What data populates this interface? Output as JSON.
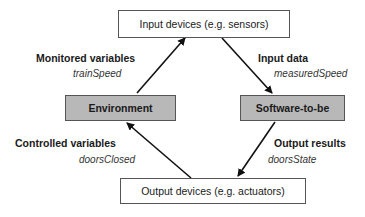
{
  "nodes": {
    "input_devices": {
      "label": "Input devices (e.g. sensors)"
    },
    "environment": {
      "label": "Environment"
    },
    "software": {
      "label": "Software-to-be"
    },
    "output_devices": {
      "label": "Output devices (e.g. actuators)"
    }
  },
  "edges": {
    "monitored": {
      "title": "Monitored variables",
      "example": "trainSpeed",
      "from": "environment",
      "to": "input_devices"
    },
    "input_data": {
      "title": "Input data",
      "example": "measuredSpeed",
      "from": "input_devices",
      "to": "software"
    },
    "output_results": {
      "title": "Output results",
      "example": "doorsState",
      "from": "software",
      "to": "output_devices"
    },
    "controlled": {
      "title": "Controlled variables",
      "example": "doorsClosed",
      "from": "output_devices",
      "to": "environment"
    }
  },
  "colors": {
    "system_fill": "#b8b8b8",
    "device_fill": "#ffffff",
    "stroke": "#111111"
  }
}
